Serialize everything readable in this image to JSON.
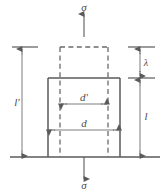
{
  "figure": {
    "type": "engineering-strain-diagram",
    "colors": {
      "line": "#5a5a5a",
      "line_light": "#7d7d7d",
      "dashed": "#6b6b6b",
      "text": "#4a4a4a",
      "background": "#ffffff"
    }
  },
  "labels": {
    "stress_top": "σ",
    "stress_bottom": "σ",
    "height_deformed": "l′",
    "height_original": "l",
    "elongation": "λ",
    "width_deformed": "d′",
    "width_original": "d"
  },
  "geometry": {
    "baseline_y": 157,
    "solid_box": {
      "x": 48,
      "y": 78,
      "width": 72,
      "height": 79
    },
    "dashed_box": {
      "x": 60,
      "y": 47,
      "width": 48,
      "height": 110
    },
    "left_dim_x": 22,
    "right_dim_x": 140,
    "axis_x": 84,
    "dim_dprime_y": 104,
    "dim_d_y": 130
  }
}
